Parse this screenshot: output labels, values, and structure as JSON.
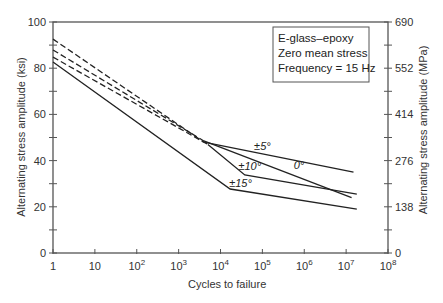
{
  "chart_data": {
    "type": "line",
    "title": "",
    "xlabel": "Cycles to failure",
    "ylabel": "Alternating stress amplitude (ksi)",
    "ylabel_right": "Alternating stress amplitude (MPa)",
    "xscale": "log",
    "xlim": [
      1,
      100000000
    ],
    "ylim": [
      0,
      100
    ],
    "ylim_right": [
      0,
      690
    ],
    "grid": false,
    "x_ticks": [
      {
        "value": 1,
        "label": "1"
      },
      {
        "value": 10,
        "label": "10"
      },
      {
        "value": 100,
        "label": "10",
        "sup": "2"
      },
      {
        "value": 1000,
        "label": "10",
        "sup": "3"
      },
      {
        "value": 10000,
        "label": "10",
        "sup": "4"
      },
      {
        "value": 100000,
        "label": "10",
        "sup": "5"
      },
      {
        "value": 1000000,
        "label": "10",
        "sup": "6"
      },
      {
        "value": 10000000,
        "label": "10",
        "sup": "7"
      },
      {
        "value": 100000000,
        "label": "10",
        "sup": "8"
      }
    ],
    "y_ticks_left": [
      0,
      20,
      40,
      60,
      80,
      100
    ],
    "y_minor_ticks_left": [
      10,
      30,
      50,
      70,
      90
    ],
    "y_ticks_right": [
      0,
      138,
      276,
      414,
      552,
      690
    ],
    "legend": {
      "position": "upper right",
      "lines": [
        "E-glass–epoxy",
        "Zero mean stress",
        "Frequency = 15 Hz"
      ]
    },
    "series": [
      {
        "name": "±5°",
        "style": "dashed-then-solid",
        "points": [
          [
            1,
            92.6
          ],
          [
            4000,
            48.0
          ],
          [
            15000000,
            35.0
          ]
        ],
        "label_at": [
          100000,
          44.5
        ]
      },
      {
        "name": "0°",
        "style": "dashed-then-solid",
        "points": [
          [
            1,
            87.9
          ],
          [
            4000,
            48.5
          ],
          [
            13500000,
            24.0
          ]
        ],
        "label_at": [
          750000,
          36.5
        ]
      },
      {
        "name": "±10°",
        "style": "dashed-then-solid",
        "points": [
          [
            1,
            84.8
          ],
          [
            5000,
            47.0
          ],
          [
            38000,
            33.8
          ],
          [
            18000000,
            25.5
          ]
        ],
        "label_at": [
          50000,
          36.0
        ]
      },
      {
        "name": "±15°",
        "style": "solid",
        "points": [
          [
            1,
            82.7
          ],
          [
            17000,
            27.7
          ],
          [
            18000000,
            19.0
          ]
        ],
        "label_at": [
          30000,
          28.5
        ]
      }
    ]
  }
}
